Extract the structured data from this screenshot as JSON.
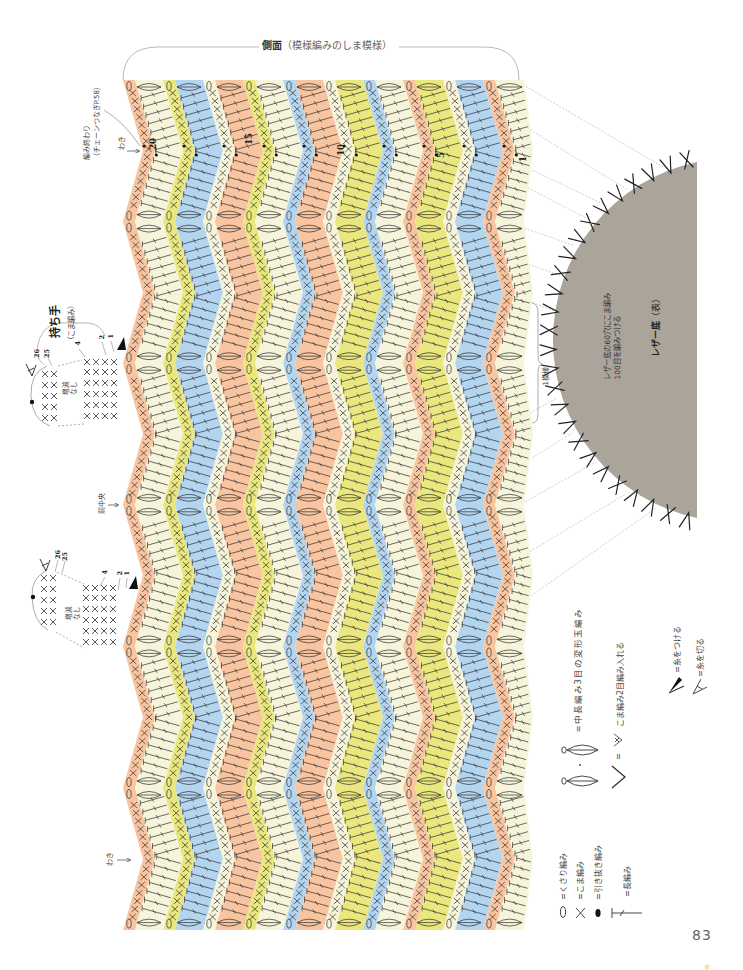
{
  "page": {
    "number": "83"
  },
  "header": {
    "title_bold": "側面",
    "title_rest": "（模様編みのしま模様）"
  },
  "annotations": {
    "finish": [
      "編み終わり",
      "（チェーンつなぎP.58）"
    ],
    "side_top": "わき",
    "side_bottom": "わき",
    "front_center": "前中央",
    "handle_title": "持ち手",
    "handle_note": "（こま編み）",
    "repeat": "1模様"
  },
  "row_numbers": [
    "20",
    "15",
    "10",
    "5",
    "1"
  ],
  "handles": [
    {
      "row_labels": [
        "26",
        "25",
        "4",
        "2",
        "1"
      ],
      "note": [
        "増減",
        "なし"
      ]
    },
    {
      "row_labels": [
        "26",
        "25",
        "4",
        "2",
        "1"
      ],
      "note": [
        "増減",
        "なし"
      ]
    }
  ],
  "leather": {
    "title": "レザー底",
    "side": "（表）",
    "note": [
      "レザー底の60穴にこま編み",
      "100目を編みつける"
    ],
    "holes": 60,
    "stitches": 100,
    "mark_sequence": "XVV"
  },
  "legend": {
    "chain": "=くさり編み",
    "sc": "=こま編み",
    "slip": "=引き抜き編み",
    "dc": "=長編み",
    "puff": "=中長編み3目の変形玉編み",
    "increase_eq": "=",
    "increase": "こま編み2目編み入れる",
    "join": "=糸をつける",
    "cut": "=糸を切る"
  },
  "colors": {
    "orange": "#f8c5a0",
    "cream": "#f6f4da",
    "yellow": "#e9e77e",
    "blue": "#b4d5f0",
    "leather": "#aaa49a",
    "stitch": "#2e2e2e",
    "guide": "#b9b9b9",
    "mark": "#222222"
  },
  "pattern": {
    "stripes": [
      {
        "row": 20,
        "color": "orange",
        "stitch": "sc"
      },
      {
        "row": 19,
        "color": "cream",
        "stitch": "dc"
      },
      {
        "row": 18,
        "color": "yellow",
        "stitch": "sc"
      },
      {
        "row": 17,
        "color": "blue",
        "stitch": "dc"
      },
      {
        "row": 16,
        "color": "cream",
        "stitch": "sc"
      },
      {
        "row": 15,
        "color": "orange",
        "stitch": "dc"
      },
      {
        "row": 14,
        "color": "yellow",
        "stitch": "sc"
      },
      {
        "row": 13,
        "color": "cream",
        "stitch": "dc"
      },
      {
        "row": 12,
        "color": "blue",
        "stitch": "sc"
      },
      {
        "row": 11,
        "color": "orange",
        "stitch": "dc"
      },
      {
        "row": 10,
        "color": "cream",
        "stitch": "sc"
      },
      {
        "row": 9,
        "color": "yellow",
        "stitch": "dc"
      },
      {
        "row": 8,
        "color": "blue",
        "stitch": "sc"
      },
      {
        "row": 7,
        "color": "cream",
        "stitch": "dc"
      },
      {
        "row": 6,
        "color": "orange",
        "stitch": "sc"
      },
      {
        "row": 5,
        "color": "yellow",
        "stitch": "dc"
      },
      {
        "row": 4,
        "color": "cream",
        "stitch": "sc"
      },
      {
        "row": 3,
        "color": "blue",
        "stitch": "dc"
      },
      {
        "row": 2,
        "color": "orange",
        "stitch": "sc"
      },
      {
        "row": 1,
        "color": "cream",
        "stitch": "dc"
      }
    ]
  }
}
